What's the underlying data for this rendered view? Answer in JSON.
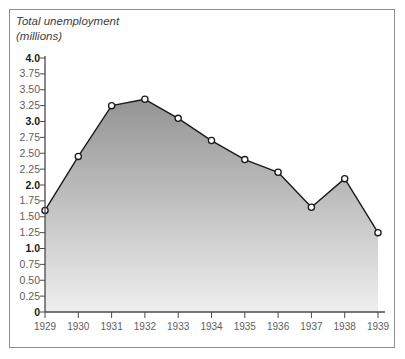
{
  "chart_data": {
    "type": "area",
    "title": "Total unemployment\n(millions)",
    "title_lines": [
      "Total unemployment",
      "(millions)"
    ],
    "xlabel": "",
    "ylabel": "Total unemployment (millions)",
    "categories": [
      "1929",
      "1930",
      "1931",
      "1932",
      "1933",
      "1934",
      "1935",
      "1936",
      "1937",
      "1938",
      "1939"
    ],
    "values": [
      1.6,
      2.45,
      3.25,
      3.35,
      3.05,
      2.7,
      2.4,
      2.2,
      1.65,
      2.1,
      1.25
    ],
    "ylim": [
      0,
      4.0
    ],
    "ytick_values": [
      0,
      0.25,
      0.5,
      0.75,
      1.0,
      1.25,
      1.5,
      1.75,
      2.0,
      2.25,
      2.5,
      2.75,
      3.0,
      3.25,
      3.5,
      3.75,
      4.0
    ],
    "ytick_labels": [
      "0",
      "0.25",
      "0.50",
      "0.75",
      "1.0",
      "1.25",
      "1.50",
      "1.75",
      "2.0",
      "2.25",
      "2.50",
      "2.75",
      "3.0",
      "3.25",
      "3.50",
      "3.75",
      "4.0"
    ],
    "ytick_major": [
      true,
      false,
      false,
      false,
      true,
      false,
      false,
      false,
      true,
      false,
      false,
      false,
      true,
      false,
      false,
      false,
      true
    ],
    "grid": false,
    "legend": "none",
    "marker": "open-circle",
    "fill": "vertical-gradient-gray-to-white",
    "colors": {
      "line": "#1a1a1a",
      "marker_fill": "#ffffff",
      "marker_stroke": "#1a1a1a",
      "fill_top": "#949494",
      "fill_bottom": "#efefef",
      "axis": "#4a4a4a",
      "frame": "#8d8d8d",
      "tick_label": "#5e5e5e",
      "major_tick_label": "#1b1b1b",
      "title_text": "#3d3d3d",
      "background": "#ffffff"
    }
  }
}
